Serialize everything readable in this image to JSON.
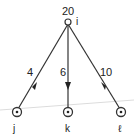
{
  "diagram": {
    "type": "directed-tree",
    "nodes": [
      {
        "id": "i",
        "label": "i",
        "value": "20",
        "x": 68,
        "y": 22
      },
      {
        "id": "j",
        "label": "j",
        "x": 17,
        "y": 112
      },
      {
        "id": "k",
        "label": "k",
        "x": 68,
        "y": 112
      },
      {
        "id": "l",
        "label": "ℓ",
        "x": 121,
        "y": 112
      }
    ],
    "edges": [
      {
        "from": "i",
        "to": "j",
        "weight": "4"
      },
      {
        "from": "i",
        "to": "k",
        "weight": "6"
      },
      {
        "from": "i",
        "to": "l",
        "weight": "10"
      }
    ],
    "colors": {
      "line": "#333333",
      "guide": "#d8d8d8"
    }
  }
}
